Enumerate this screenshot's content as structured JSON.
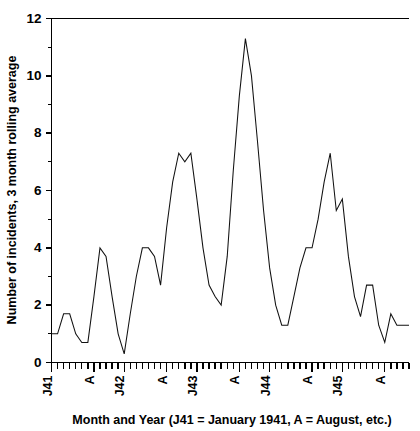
{
  "chart_data": {
    "type": "line",
    "title": "",
    "xlabel": "Month and Year (J41 = January 1941, A = August, etc.)",
    "ylabel": "Number of incidents, 3 month rolling average",
    "ylim": [
      0,
      12
    ],
    "ytick_values": [
      0,
      2,
      4,
      6,
      8,
      10,
      12
    ],
    "ytick_labels": [
      "0",
      "2",
      "4",
      "6",
      "8",
      "10",
      "12"
    ],
    "yminor_values": [
      1,
      3,
      5,
      7,
      9,
      11
    ],
    "grid": false,
    "legend": null,
    "xlim": [
      0,
      59
    ],
    "xtick_labels": [
      "J41",
      "A",
      "J42",
      "A",
      "J43",
      "A",
      "J44",
      "A",
      "J45",
      "A"
    ],
    "xtick_positions": [
      0,
      7,
      12,
      19,
      24,
      31,
      36,
      43,
      48,
      55
    ],
    "xminor_count": 60,
    "x": [
      0,
      1,
      2,
      3,
      4,
      5,
      6,
      7,
      8,
      9,
      10,
      11,
      12,
      13,
      14,
      15,
      16,
      17,
      18,
      19,
      20,
      21,
      22,
      23,
      24,
      25,
      26,
      27,
      28,
      29,
      30,
      31,
      32,
      33,
      34,
      35,
      36,
      37,
      38,
      39,
      40,
      41,
      42,
      43,
      44,
      45,
      46,
      47,
      48,
      49,
      50,
      51,
      52,
      53,
      54,
      55,
      56,
      57,
      58,
      59
    ],
    "values": [
      1.0,
      1.0,
      1.7,
      1.7,
      1.0,
      0.7,
      0.7,
      2.3,
      4.0,
      3.7,
      2.3,
      1.0,
      0.3,
      1.7,
      3.0,
      4.0,
      4.0,
      3.7,
      2.7,
      4.7,
      6.3,
      7.3,
      7.0,
      7.3,
      5.7,
      4.0,
      2.7,
      2.3,
      2.0,
      3.7,
      6.7,
      9.3,
      11.3,
      10.0,
      7.7,
      5.3,
      3.3,
      2.0,
      1.3,
      1.3,
      2.3,
      3.3,
      4.0,
      4.0,
      5.0,
      6.3,
      7.3,
      5.3,
      5.7,
      3.7,
      2.3,
      1.6,
      2.7,
      2.7,
      1.3,
      0.7,
      1.7,
      1.3,
      1.3,
      1.3
    ],
    "series_name": "Number of incidents, 3 month rolling average"
  },
  "figure": {
    "background_color": "#ffffff",
    "line_color": "#111111",
    "axis_color": "#000000"
  }
}
